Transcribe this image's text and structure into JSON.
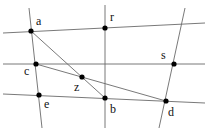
{
  "diagram": {
    "type": "geometry-incidence",
    "line_color": "#6a6a6a",
    "point_color": "#000000",
    "points": [
      {
        "id": "a",
        "label": "a",
        "x": 31,
        "y": 31,
        "lx": 36,
        "ly": 25
      },
      {
        "id": "r",
        "label": "r",
        "x": 105,
        "y": 28,
        "lx": 110,
        "ly": 21
      },
      {
        "id": "c",
        "label": "c",
        "x": 36,
        "y": 64,
        "lx": 24,
        "ly": 75
      },
      {
        "id": "s",
        "label": "s",
        "x": 174,
        "y": 64,
        "lx": 161,
        "ly": 59
      },
      {
        "id": "z",
        "label": "z",
        "x": 82,
        "y": 77,
        "lx": 74,
        "ly": 91
      },
      {
        "id": "e",
        "label": "e",
        "x": 39,
        "y": 95,
        "lx": 44,
        "ly": 108
      },
      {
        "id": "b",
        "label": "b",
        "x": 105,
        "y": 98,
        "lx": 110,
        "ly": 113
      },
      {
        "id": "d",
        "label": "d",
        "x": 166,
        "y": 101,
        "lx": 168,
        "ly": 116
      }
    ],
    "lines": [
      {
        "id": "top-line",
        "x1": 3,
        "y1": 33,
        "x2": 205,
        "y2": 23
      },
      {
        "id": "middle-line",
        "x1": 3,
        "y1": 64,
        "x2": 205,
        "y2": 64
      },
      {
        "id": "bottom-line",
        "x1": 3,
        "y1": 94,
        "x2": 205,
        "y2": 103
      },
      {
        "id": "left-line",
        "x1": 29,
        "y1": 8,
        "x2": 42,
        "y2": 128
      },
      {
        "id": "center-line",
        "x1": 105,
        "y1": 5,
        "x2": 105,
        "y2": 128
      },
      {
        "id": "right-line",
        "x1": 185,
        "y1": 8,
        "x2": 159,
        "y2": 128
      },
      {
        "id": "segment-ab",
        "x1": 31,
        "y1": 31,
        "x2": 105,
        "y2": 98
      },
      {
        "id": "segment-cd",
        "x1": 36,
        "y1": 64,
        "x2": 166,
        "y2": 101
      }
    ]
  }
}
